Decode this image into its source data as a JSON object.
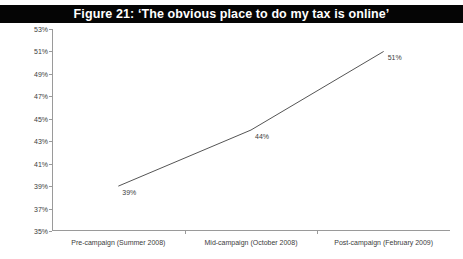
{
  "figure": {
    "title": "Figure 21: ‘The obvious place to do my tax is online’",
    "title_bar_color": "#050505",
    "title_text_color": "#ffffff",
    "background_color": "#ffffff"
  },
  "chart_data": {
    "type": "line",
    "title": "Figure 21: ‘The obvious place to do my tax is online’",
    "xlabel": "",
    "ylabel": "% agree 'the obvious place to do my tax is online'",
    "categories": [
      "Pre-campaign (Summer 2008)",
      "Mid-campaign (October 2008)",
      "Post-campaign (February 2009)"
    ],
    "values": [
      39,
      44,
      51
    ],
    "data_labels": [
      "39%",
      "44%",
      "51%"
    ],
    "ylim": [
      35,
      53
    ],
    "ytick_values": [
      35,
      37,
      39,
      41,
      43,
      45,
      47,
      49,
      51,
      53
    ],
    "ytick_labels": [
      "35%",
      "37%",
      "39%",
      "41%",
      "43%",
      "45%",
      "47%",
      "49%",
      "51%",
      "53%"
    ],
    "grid": false,
    "legend": false,
    "line_color": "#555555",
    "line_width": 1,
    "markers": false,
    "axis_color": "#9a9a9a"
  }
}
